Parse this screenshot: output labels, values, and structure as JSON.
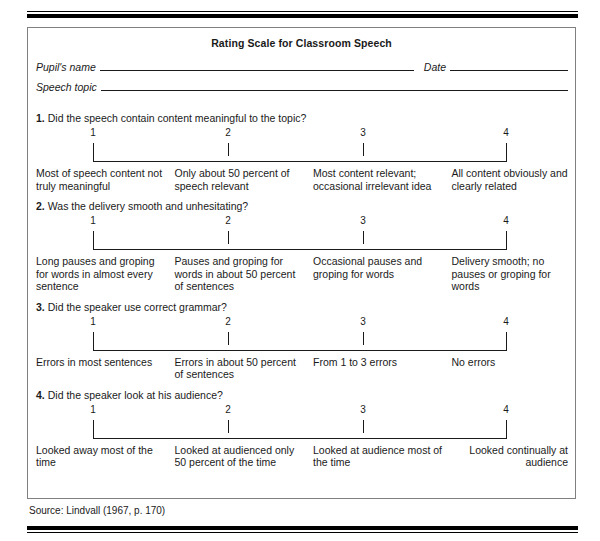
{
  "form": {
    "title": "Rating Scale for Classroom Speech",
    "identification": {
      "name_label": "Pupil's name",
      "date_label": "Date",
      "topic_label": "Speech topic"
    },
    "scale_points": [
      "1",
      "2",
      "3",
      "4"
    ],
    "questions": [
      {
        "number": "1.",
        "text": "Did the speech contain content meaningful to the topic?",
        "anchors": [
          "Most of speech content not truly meaningful",
          "Only about 50 percent of speech relevant",
          "Most content relevant; occasional irrelevant idea",
          "All content obviously and clearly related"
        ]
      },
      {
        "number": "2.",
        "text": "Was the delivery smooth and unhesitating?",
        "anchors": [
          "Long pauses and groping for words in almost every sentence",
          "Pauses and groping for words in about 50 percent of sentences",
          "Occasional pauses and groping for words",
          "Delivery smooth; no pauses or groping for words"
        ]
      },
      {
        "number": "3.",
        "text": "Did the speaker use correct grammar?",
        "anchors": [
          "Errors in most sentences",
          "Errors in about 50 percent of sentences",
          "From 1 to 3 errors",
          "No errors"
        ]
      },
      {
        "number": "4.",
        "text": "Did the speaker look at his audience?",
        "anchors": [
          "Looked away most of the time",
          "Looked at audienced only 50 percent of the time",
          "Looked at audience most of the time",
          "Looked continually at audience"
        ]
      }
    ]
  },
  "source": "Source: Lindvall (1967, p. 170)"
}
